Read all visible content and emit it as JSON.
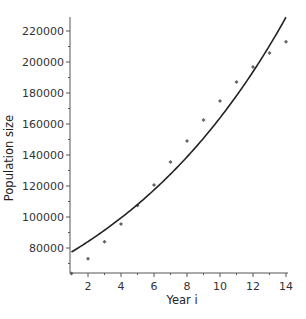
{
  "chart_data": {
    "type": "scatter",
    "title": "",
    "xlabel": "Year i",
    "ylabel": "Population size",
    "xlim": [
      0.9,
      14.1
    ],
    "ylim": [
      64000,
      229000
    ],
    "grid": false,
    "legend": null,
    "x_ticks": [
      2,
      4,
      6,
      8,
      10,
      12,
      14
    ],
    "x_minor_ticks": [
      1,
      3,
      5,
      7,
      9,
      11,
      13
    ],
    "y_ticks": [
      80000,
      100000,
      120000,
      140000,
      160000,
      180000,
      200000,
      220000
    ],
    "y_minor_ticks": [
      70000,
      90000,
      110000,
      130000,
      150000,
      170000,
      190000,
      210000
    ],
    "series": [
      {
        "name": "Observed population",
        "kind": "scatter",
        "marker": "diamond",
        "color": "#666666",
        "x": [
          1,
          2,
          3,
          4,
          5,
          6,
          7,
          8,
          9,
          10,
          11,
          12,
          13,
          14
        ],
        "values": [
          63500,
          73000,
          84000,
          95500,
          107500,
          120600,
          135500,
          149000,
          162600,
          174800,
          187100,
          196800,
          205800,
          213000
        ]
      },
      {
        "name": "Exponential fit",
        "kind": "line",
        "color": "#222222",
        "model": "N(i) = N1 * exp(r * (i - 1))",
        "params": {
          "N1": 77400,
          "r": 0.0834
        },
        "x_range": [
          1,
          14
        ]
      }
    ]
  }
}
